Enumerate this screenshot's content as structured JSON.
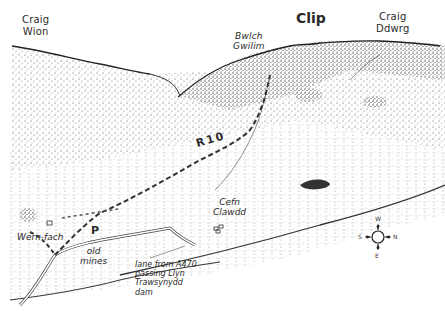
{
  "map": {
    "type": "hand-drawn panoramic sketch map",
    "peaks": [
      {
        "id": "craig-wion",
        "line1": "Craig",
        "line2": "Wion"
      },
      {
        "id": "bwlch-gwilim",
        "line1": "Bwlch",
        "line2": "Gwilim"
      },
      {
        "id": "clip",
        "label": "Clip"
      },
      {
        "id": "craig-ddwrg",
        "line1": "Craig",
        "line2": "Ddwrg"
      }
    ],
    "route": {
      "label": "R10"
    },
    "places": {
      "wern_fach": "Wern-fach",
      "cefn_clawdd": {
        "line1": "Cefn",
        "line2": "Clawdd"
      },
      "old_mines": {
        "line1": "old",
        "line2": "mines"
      },
      "parking": "P"
    },
    "lane_note": {
      "line1": "lane from A470",
      "line2": "passing Llyn",
      "line3": "Trawsynydd",
      "line4": "dam"
    },
    "compass": {
      "top": "W",
      "right": "N",
      "bottom": "E",
      "left": "S"
    },
    "colors": {
      "ink": "#2a2a2a",
      "paper": "#ffffff",
      "stipple": "#6b6b6b"
    }
  }
}
